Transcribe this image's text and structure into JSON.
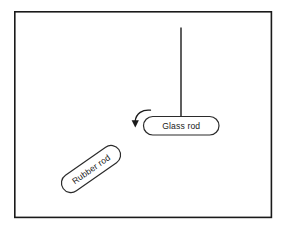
{
  "figure": {
    "background_color": "#ffffff",
    "frame": {
      "name": "diagram-border",
      "stroke_color": "#1a1a1a",
      "x": 14,
      "y": 11,
      "width": 258,
      "height": 207
    },
    "elements": {
      "glass_rod": {
        "label": "Glass rod",
        "capsule": {
          "x": 143,
          "y": 116,
          "width": 76,
          "height": 19,
          "radius": 9.5,
          "fill": "#ffffff",
          "stroke": "#2b2b2b"
        },
        "stem": {
          "x": 181,
          "y_top": 27,
          "y_bottom": 117,
          "stroke": "#1a1a1a"
        }
      },
      "rubber_rod": {
        "label": "Rubber rod",
        "capsule": {
          "center_x": 91,
          "center_y": 169,
          "length": 68,
          "thickness": 19,
          "rotation_deg": -35,
          "fill": "#ffffff",
          "stroke": "#2b2b2b"
        }
      },
      "motion_arrow": {
        "name": "curved-motion-arrow",
        "direction": "down-left",
        "stroke": "#1a1a1a",
        "tip_x": 135,
        "tip_y": 127
      }
    }
  }
}
